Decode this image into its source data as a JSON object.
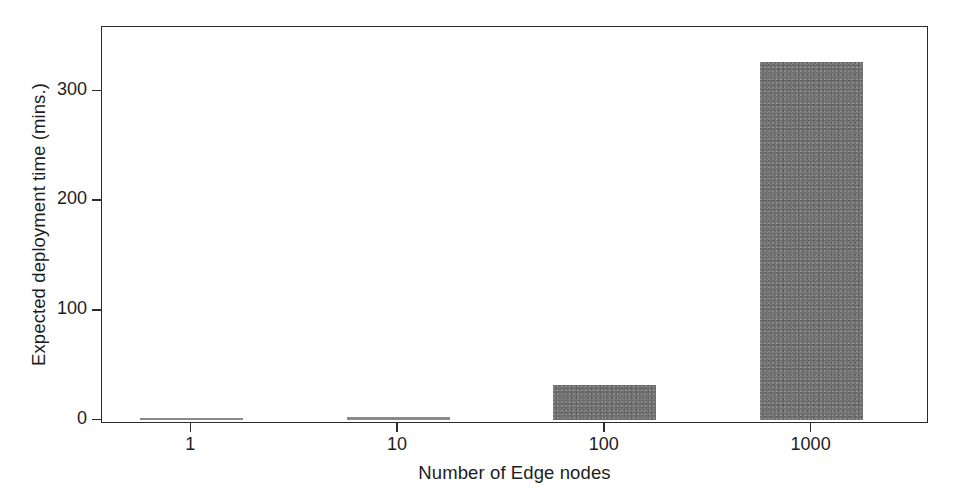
{
  "chart_data": {
    "type": "bar",
    "title": "",
    "xlabel": "Number of Edge nodes",
    "ylabel": "Expected deployment time (mins.)",
    "categories": [
      "1",
      "10",
      "100",
      "1000"
    ],
    "values": [
      0.5,
      2,
      32,
      326
    ],
    "x_tick_labels": [
      "1",
      "10",
      "100",
      "1000"
    ],
    "y_tick_labels": [
      "0",
      "100",
      "200",
      "300"
    ],
    "y_tick_values": [
      0,
      100,
      200,
      300
    ],
    "ylim": [
      -4,
      358
    ],
    "xlim_categories": 4,
    "grid": false,
    "legend": false,
    "legend_position": "none",
    "bar_color": "#6e6e6e",
    "axis_color": "#2b2b2b",
    "background_color": "#ffffff",
    "x_scale": "log-categorical"
  },
  "axes": {
    "y_title": "Expected deployment time (mins.)",
    "x_title": "Number of Edge nodes"
  }
}
